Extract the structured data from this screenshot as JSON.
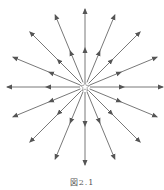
{
  "figure": {
    "caption": "図2.1",
    "center": [
      85,
      87
    ],
    "radius": 78,
    "ray_count": 16,
    "line_color": "#555555",
    "center_marker": "star-outline"
  }
}
